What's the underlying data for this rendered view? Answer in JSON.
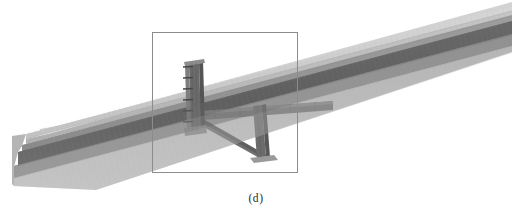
{
  "figure": {
    "caption": "(d)",
    "view_type": "3d-render",
    "background_color": "#ffffff"
  },
  "colors": {
    "background": "#ffffff",
    "top_flange_top_face": "#b9b9b9",
    "top_flange_edge_bevel": "#cfcfcf",
    "top_flange_front_face": "#949494",
    "web_shadow_dark": "#5a5a5a",
    "web_mid": "#7d7d7d",
    "bottom_flange_front_face": "#8f8f8f",
    "bottom_flange_bottom_face": "#a8a8a8",
    "bottom_flange_highlight": "#c4c4c4",
    "stiffener_plate": "#6e6e6e",
    "stiffener_plate_dark": "#565656",
    "diagonal_brace": "#6a6a6a",
    "transverse_plate": "#747474",
    "bolt_mark": "#4a4a4a",
    "selection_box_stroke": "#8c8c8c",
    "caption_text": "#2b2b2b",
    "mesh_line": "#9a9a9a"
  },
  "selection_box": {
    "name": "detail-highlight-rectangle",
    "x": 152,
    "y": 32,
    "width": 145,
    "height": 140,
    "stroke_width": 1
  },
  "geometry": {
    "beam_axis": {
      "left_end_x": 12,
      "left_end_y": 156,
      "right_end_x": 512,
      "right_end_y": 26
    },
    "members": [
      {
        "name": "main-girder-top-flange",
        "label": "top flange"
      },
      {
        "name": "main-girder-web",
        "label": "web"
      },
      {
        "name": "main-girder-bottom-flange",
        "label": "bottom flange"
      },
      {
        "name": "vertical-stiffener-plate",
        "label": "vertical stiffener plate"
      },
      {
        "name": "bolt-row",
        "label": "bolt row",
        "count": 6
      },
      {
        "name": "transverse-connection-plate",
        "label": "transverse connection plate"
      },
      {
        "name": "diagonal-brace-member",
        "label": "diagonal brace member"
      },
      {
        "name": "secondary-vertical-plate",
        "label": "secondary vertical plate"
      }
    ]
  }
}
